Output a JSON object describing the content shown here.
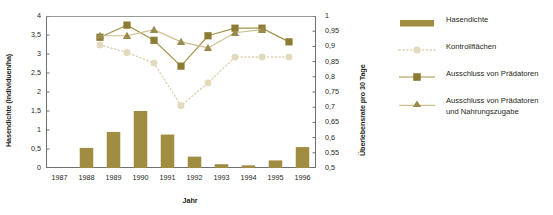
{
  "chart_data": {
    "type": "bar",
    "title": "",
    "xlabel": "Jahr",
    "ylabel": "Hasendichte (Individuen/ha)",
    "ylabel_right": "Überlebensrate pro 30 Tage",
    "grid": false,
    "legend_position": "right",
    "categories": [
      "1987",
      "1988",
      "1989",
      "1990",
      "1991",
      "1992",
      "1993",
      "1994",
      "1995",
      "1996"
    ],
    "x_tick_labels": [
      "1987",
      "1988",
      "1989",
      "1990",
      "1991",
      "1992",
      "1993",
      "1994",
      "1995",
      "1996"
    ],
    "y_tick_labels_left": [
      "4",
      "3,5",
      "3",
      "2,5",
      "2",
      "1,5",
      "1",
      "0,5",
      "0"
    ],
    "y_tick_values_left": [
      4,
      3.5,
      3,
      2.5,
      2,
      1.5,
      1,
      0.5,
      0
    ],
    "y_tick_labels_right": [
      "1",
      "0,95",
      "0,9",
      "0,85",
      "0,8",
      "0,75",
      "0,7",
      "0,65",
      "0,6",
      "0,55",
      "0,5"
    ],
    "y_tick_values_right": [
      1,
      0.95,
      0.9,
      0.85,
      0.8,
      0.75,
      0.7,
      0.65,
      0.6,
      0.55,
      0.5
    ],
    "ylim_left": [
      0,
      4
    ],
    "ylim_right": [
      0.5,
      1
    ],
    "bar_series": {
      "name": "Hasendichte",
      "axis": "left",
      "color": "#a08d42",
      "x": [
        "1988",
        "1989",
        "1990",
        "1991",
        "1992",
        "1993",
        "1994",
        "1995",
        "1996"
      ],
      "values": [
        0.53,
        0.95,
        1.5,
        0.88,
        0.3,
        0.1,
        0.07,
        0.2,
        0.55
      ]
    },
    "line_series": [
      {
        "name": "Kontrollflächen",
        "axis": "right",
        "color": "#ddd3ae",
        "marker": "circle",
        "linestyle": "dotted",
        "x": [
          "1988,5",
          "1989,5",
          "1990,5",
          "1991,5",
          "1992,5",
          "1993,5",
          "1994,5",
          "1995,5"
        ],
        "values": [
          0.905,
          0.88,
          0.845,
          0.705,
          0.78,
          0.865,
          0.865,
          0.865
        ]
      },
      {
        "name": "Ausschluss von Prädatoren",
        "axis": "right",
        "color": "#8d7a33",
        "marker": "square",
        "linestyle": "solid",
        "x": [
          "1988,5",
          "1989,5",
          "1990,5",
          "1991,5",
          "1992,5",
          "1993,5",
          "1994,5",
          "1995,5"
        ],
        "values": [
          0.93,
          0.97,
          0.92,
          0.835,
          0.935,
          0.96,
          0.96,
          0.915
        ]
      },
      {
        "name": "Ausschluss von Prädatoren und Nahrungszugabe",
        "axis": "right",
        "color": "#9a8a4e",
        "marker": "triangle",
        "linestyle": "solid",
        "x": [
          "1988,5",
          "1989,5",
          "1990,5",
          "1991,5",
          "1992,5",
          "1993,5",
          "1994,5"
        ],
        "values": [
          0.935,
          0.935,
          0.955,
          0.915,
          0.895,
          0.945,
          0.955
        ]
      }
    ],
    "legend": [
      {
        "label": "Hasendichte",
        "marker": "bar",
        "color": "#a08d42"
      },
      {
        "label": "Kontrollflächen",
        "marker": "circle-dotted",
        "color": "#ddd3ae"
      },
      {
        "label": "Ausschluss von Prädatoren",
        "marker": "square-solid",
        "color": "#8d7a33"
      },
      {
        "label": "Ausschluss von Prädatoren und Nahrungszugabe",
        "marker": "triangle-solid",
        "color": "#9a8a4e"
      }
    ]
  }
}
